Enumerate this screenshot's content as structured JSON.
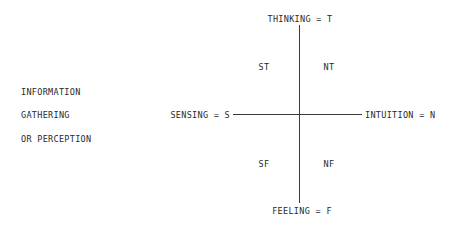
{
  "side_label": {
    "lines": [
      "INFORMATION",
      "GATHERING",
      "OR PERCEPTION"
    ]
  },
  "axes": {
    "top": "THINKING = T",
    "bottom": "FEELING = F",
    "left": "SENSING = S",
    "right": "INTUITION = N"
  },
  "quadrants": {
    "top_left": "ST",
    "top_right": "NT",
    "bottom_left": "SF",
    "bottom_right": "NF"
  },
  "colors": {
    "line": "#3a3a3a",
    "text": "#2a2a2a",
    "background": "#ffffff"
  }
}
